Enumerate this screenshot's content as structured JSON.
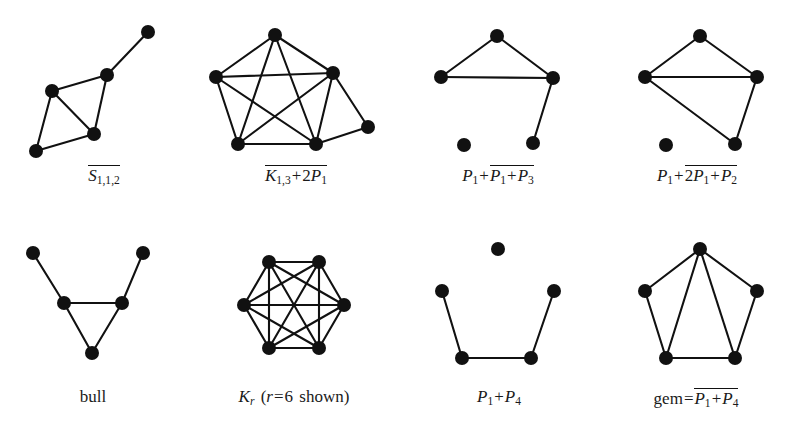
{
  "figure": {
    "background_color": "#ffffff",
    "node_color": "#111111",
    "edge_color": "#111111",
    "node_radius": 7,
    "edge_width": 2.1,
    "width": 796,
    "height": 446
  },
  "graphs": [
    {
      "id": "complement-s112",
      "caption_text": "S(1,1,2) complement",
      "caption_parts": [
        {
          "type": "overline",
          "text": "S",
          "sub": "1,1,2"
        }
      ],
      "caption_center_x": 104,
      "caption_y": 172,
      "vertices": [
        {
          "name": "v0",
          "x": 148,
          "y": 32
        },
        {
          "name": "v1",
          "x": 107,
          "y": 75
        },
        {
          "name": "v2",
          "x": 52,
          "y": 91
        },
        {
          "name": "v3",
          "x": 94,
          "y": 134
        },
        {
          "name": "v4",
          "x": 36,
          "y": 151
        }
      ],
      "edges": [
        [
          0,
          1
        ],
        [
          1,
          2
        ],
        [
          1,
          3
        ],
        [
          2,
          3
        ],
        [
          2,
          4
        ],
        [
          3,
          4
        ]
      ]
    },
    {
      "id": "complement-k13-plus-2p1",
      "caption_text": "K(1,3) + 2P1 complement",
      "caption_parts": [
        {
          "type": "overline",
          "text": "K",
          "sub": "1,3",
          "tail": " + 2P",
          "tail_sub": "1"
        }
      ],
      "caption_center_x": 296,
      "caption_y": 172,
      "vertices": [
        {
          "name": "top",
          "x": 275,
          "y": 35
        },
        {
          "name": "left",
          "x": 216,
          "y": 77
        },
        {
          "name": "right",
          "x": 333,
          "y": 73
        },
        {
          "name": "bottomleft",
          "x": 238,
          "y": 144
        },
        {
          "name": "bottomright",
          "x": 316,
          "y": 144
        },
        {
          "name": "pendant",
          "x": 368,
          "y": 127
        }
      ],
      "edges": [
        [
          0,
          1
        ],
        [
          0,
          2
        ],
        [
          0,
          3
        ],
        [
          0,
          4
        ],
        [
          1,
          2
        ],
        [
          1,
          3
        ],
        [
          1,
          4
        ],
        [
          2,
          3
        ],
        [
          2,
          4
        ],
        [
          3,
          4
        ],
        [
          2,
          5
        ],
        [
          4,
          5
        ]
      ]
    },
    {
      "id": "p1-plus-complement-p1-plus-p3",
      "caption_text": "P1 + complement of (P1 + P3)",
      "caption_center_x": 498,
      "caption_y": 172,
      "vertices": [
        {
          "name": "apex",
          "x": 497,
          "y": 36
        },
        {
          "name": "left",
          "x": 441,
          "y": 77
        },
        {
          "name": "right",
          "x": 553,
          "y": 78
        },
        {
          "name": "bottomright",
          "x": 533,
          "y": 143
        },
        {
          "name": "isolated",
          "x": 464,
          "y": 145
        }
      ],
      "edges": [
        [
          0,
          1
        ],
        [
          0,
          2
        ],
        [
          1,
          2
        ],
        [
          2,
          3
        ]
      ]
    },
    {
      "id": "p1-plus-complement-2p1-plus-p2",
      "caption_text": "P1 + complement of (2P1 + P2)",
      "caption_center_x": 700,
      "caption_y": 172,
      "vertices": [
        {
          "name": "apex",
          "x": 700,
          "y": 36
        },
        {
          "name": "left",
          "x": 645,
          "y": 77
        },
        {
          "name": "right",
          "x": 757,
          "y": 77
        },
        {
          "name": "bottomright",
          "x": 735,
          "y": 144
        },
        {
          "name": "isolated",
          "x": 666,
          "y": 145
        }
      ],
      "edges": [
        [
          0,
          1
        ],
        [
          0,
          2
        ],
        [
          1,
          2
        ],
        [
          1,
          3
        ],
        [
          2,
          3
        ]
      ]
    },
    {
      "id": "bull",
      "caption_text": "bull",
      "caption_center_x": 92,
      "caption_y": 396,
      "vertices": [
        {
          "name": "topleft",
          "x": 33,
          "y": 253
        },
        {
          "name": "topright",
          "x": 143,
          "y": 253
        },
        {
          "name": "midleft",
          "x": 64,
          "y": 303
        },
        {
          "name": "midright",
          "x": 122,
          "y": 303
        },
        {
          "name": "bottom",
          "x": 92,
          "y": 353
        }
      ],
      "edges": [
        [
          0,
          2
        ],
        [
          1,
          3
        ],
        [
          2,
          3
        ],
        [
          2,
          4
        ],
        [
          3,
          4
        ]
      ]
    },
    {
      "id": "kr-complete",
      "caption_text": "K_r (r = 6 shown)",
      "caption_center_x": 294,
      "caption_y": 396,
      "vertices": [
        {
          "name": "v1",
          "x": 269,
          "y": 262
        },
        {
          "name": "v2",
          "x": 319,
          "y": 262
        },
        {
          "name": "v3",
          "x": 344,
          "y": 305
        },
        {
          "name": "v4",
          "x": 319,
          "y": 348
        },
        {
          "name": "v5",
          "x": 269,
          "y": 348
        },
        {
          "name": "v6",
          "x": 244,
          "y": 305
        }
      ],
      "edges": [
        [
          0,
          1
        ],
        [
          0,
          2
        ],
        [
          0,
          3
        ],
        [
          0,
          4
        ],
        [
          0,
          5
        ],
        [
          1,
          2
        ],
        [
          1,
          3
        ],
        [
          1,
          4
        ],
        [
          1,
          5
        ],
        [
          2,
          3
        ],
        [
          2,
          4
        ],
        [
          2,
          5
        ],
        [
          3,
          4
        ],
        [
          3,
          5
        ],
        [
          4,
          5
        ]
      ]
    },
    {
      "id": "p1-plus-p4",
      "caption_text": "P1 + P4",
      "caption_center_x": 498,
      "caption_y": 396,
      "vertices": [
        {
          "name": "isolated",
          "x": 498,
          "y": 249
        },
        {
          "name": "left",
          "x": 442,
          "y": 291
        },
        {
          "name": "right",
          "x": 554,
          "y": 291
        },
        {
          "name": "bottomleft",
          "x": 462,
          "y": 358
        },
        {
          "name": "bottomright",
          "x": 531,
          "y": 358
        }
      ],
      "edges": [
        [
          1,
          3
        ],
        [
          3,
          4
        ],
        [
          4,
          2
        ]
      ]
    },
    {
      "id": "gem",
      "caption_text": "gem = complement of (P1 + P4)",
      "caption_center_x": 700,
      "caption_y": 396,
      "vertices": [
        {
          "name": "apex",
          "x": 700,
          "y": 249
        },
        {
          "name": "left",
          "x": 645,
          "y": 291
        },
        {
          "name": "right",
          "x": 757,
          "y": 291
        },
        {
          "name": "bottomleft",
          "x": 666,
          "y": 358
        },
        {
          "name": "bottomright",
          "x": 735,
          "y": 358
        }
      ],
      "edges": [
        [
          0,
          1
        ],
        [
          0,
          2
        ],
        [
          0,
          3
        ],
        [
          0,
          4
        ],
        [
          1,
          3
        ],
        [
          2,
          4
        ],
        [
          3,
          4
        ]
      ]
    }
  ],
  "captions": {
    "g1": {
      "sym": "S",
      "sub": "1,1,2"
    },
    "g2": {
      "sym": "K",
      "sub": "1,3",
      "plus": "+",
      "coef": "2",
      "sym2": "P",
      "sub2": "1"
    },
    "g3": {
      "lead_sym": "P",
      "lead_sub": "1",
      "plus": "+",
      "sym": "P",
      "sub": "1",
      "plus2": "+",
      "sym2": "P",
      "sub2": "3"
    },
    "g4": {
      "lead_sym": "P",
      "lead_sub": "1",
      "plus": "+",
      "coef": "2",
      "sym": "P",
      "sub": "1",
      "plus2": "+",
      "sym2": "P",
      "sub2": "2"
    },
    "g5": {
      "text": "bull"
    },
    "g6": {
      "sym": "K",
      "sub": "r",
      "paren_open": "(",
      "var": "r",
      "eq": "=",
      "num": "6",
      "word": "shown",
      "paren_close": ")"
    },
    "g7": {
      "sym": "P",
      "sub": "1",
      "plus": "+",
      "sym2": "P",
      "sub2": "4"
    },
    "g8": {
      "word": "gem",
      "eq": "=",
      "sym": "P",
      "sub": "1",
      "plus": "+",
      "sym2": "P",
      "sub2": "4"
    }
  }
}
